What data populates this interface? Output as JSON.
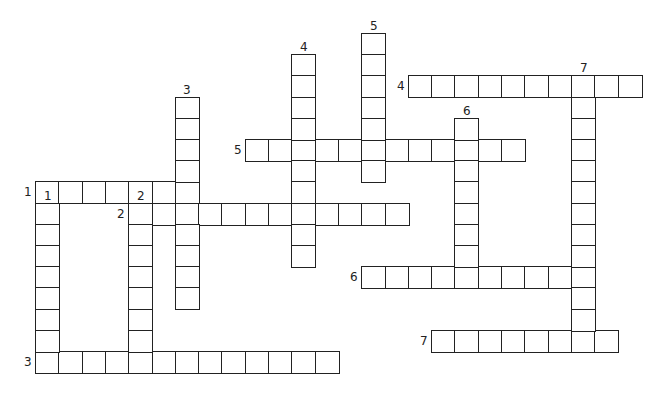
{
  "puzzle": {
    "grid": {
      "origin_x": 35,
      "origin_y": 33,
      "cell_w": 23.3,
      "cell_h": 21.2
    },
    "across": [
      {
        "number": "1",
        "row": 7,
        "col": 0,
        "length": 7
      },
      {
        "number": "2",
        "row": 8,
        "col": 4,
        "length": 12
      },
      {
        "number": "3",
        "row": 15,
        "col": 0,
        "length": 13
      },
      {
        "number": "4",
        "row": 2,
        "col": 16,
        "length": 10
      },
      {
        "number": "5",
        "row": 5,
        "col": 9,
        "length": 12
      },
      {
        "number": "6",
        "row": 11,
        "col": 14,
        "length": 10
      },
      {
        "number": "7",
        "row": 14,
        "col": 17,
        "length": 8
      }
    ],
    "down": [
      {
        "number": "1",
        "row": 8,
        "col": 0,
        "length": 8
      },
      {
        "number": "2",
        "row": 8,
        "col": 4,
        "length": 8
      },
      {
        "number": "3",
        "row": 3,
        "col": 6,
        "length": 10
      },
      {
        "number": "4",
        "row": 1,
        "col": 11,
        "length": 10
      },
      {
        "number": "5",
        "row": 0,
        "col": 14,
        "length": 7
      },
      {
        "number": "6",
        "row": 4,
        "col": 18,
        "length": 8
      },
      {
        "number": "7",
        "row": 2,
        "col": 23,
        "length": 13
      }
    ]
  }
}
